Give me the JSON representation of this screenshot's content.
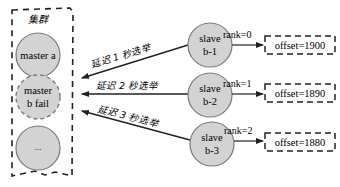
{
  "cluster": {
    "title": "集群",
    "nodes": [
      {
        "label_line1": "master a",
        "label_line2": "",
        "state": "normal"
      },
      {
        "label_line1": "master",
        "label_line2": "b fail",
        "state": "failed"
      },
      {
        "label_line1": "...",
        "label_line2": "",
        "state": "normal"
      }
    ]
  },
  "slaves": [
    {
      "line1": "slave",
      "line2": "b-1",
      "rank": "rank=0",
      "offset": "offset=1900",
      "delay_label": "延迟 1 秒选举"
    },
    {
      "line1": "slave",
      "line2": "b-2",
      "rank": "rank=1",
      "offset": "offset=1890",
      "delay_label": "延迟 2 秒选举"
    },
    {
      "line1": "slave",
      "line2": "b-3",
      "rank": "rank=2",
      "offset": "offset=1880",
      "delay_label": "延迟 3 秒选举"
    }
  ],
  "colors": {
    "node_fill": "#d3d3d3",
    "node_stroke": "#7a7a7a",
    "line": "#222222",
    "text": "#2a2a2a"
  }
}
